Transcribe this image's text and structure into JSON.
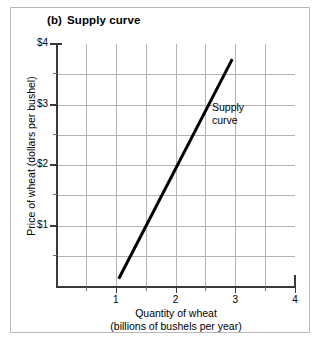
{
  "figure": {
    "panel_tag": "(b)",
    "panel_title": "Supply curve"
  },
  "chart_data": {
    "type": "line",
    "xlabel": "Quantity of wheat (billions of bushels per year)",
    "xlabel_line1": "Quantity of wheat",
    "xlabel_line2": "(billions of bushels per year)",
    "ylabel": "Price of wheat (dollars per bushel)",
    "xlim": [
      0,
      4
    ],
    "ylim": [
      0,
      4
    ],
    "x_major_ticks": [
      1,
      2,
      3,
      4
    ],
    "x_major_tick_labels": [
      "1",
      "2",
      "3",
      "4"
    ],
    "x_minor_ticks": [
      0.5,
      1.5,
      2.5,
      3.5
    ],
    "y_major_ticks": [
      1,
      2,
      3,
      4
    ],
    "y_major_tick_labels": [
      "$1",
      "$2",
      "$3",
      "$4"
    ],
    "y_minor_ticks": [
      0.5,
      1.5,
      2.5,
      3.5
    ],
    "grid": true,
    "grid_color": "#b4b4b4",
    "legend": null,
    "series": [
      {
        "name": "Supply curve",
        "color": "#000000",
        "line_width": 3,
        "points": [
          {
            "x": 1.05,
            "y": 0.12
          },
          {
            "x": 2.95,
            "y": 3.75
          }
        ]
      }
    ],
    "annotations": [
      {
        "text": "Supply curve",
        "line1": "Supply",
        "line2": "curve",
        "x": 2.6,
        "y": 3.1
      }
    ]
  },
  "axis_ticks": {
    "y": [
      {
        "value": 4,
        "label": "$4",
        "major": true
      },
      {
        "value": 3.5,
        "label": "",
        "major": false
      },
      {
        "value": 3,
        "label": "$3",
        "major": true
      },
      {
        "value": 2.5,
        "label": "",
        "major": false
      },
      {
        "value": 2,
        "label": "$2",
        "major": true
      },
      {
        "value": 1.5,
        "label": "",
        "major": false
      },
      {
        "value": 1,
        "label": "$1",
        "major": true
      },
      {
        "value": 0.5,
        "label": "",
        "major": false
      }
    ],
    "x": [
      {
        "value": 0.5,
        "label": "",
        "major": false
      },
      {
        "value": 1,
        "label": "1",
        "major": true
      },
      {
        "value": 1.5,
        "label": "",
        "major": false
      },
      {
        "value": 2,
        "label": "2",
        "major": true
      },
      {
        "value": 2.5,
        "label": "",
        "major": false
      },
      {
        "value": 3,
        "label": "3",
        "major": true
      },
      {
        "value": 3.5,
        "label": "",
        "major": false
      },
      {
        "value": 4,
        "label": "4",
        "major": true
      }
    ]
  }
}
